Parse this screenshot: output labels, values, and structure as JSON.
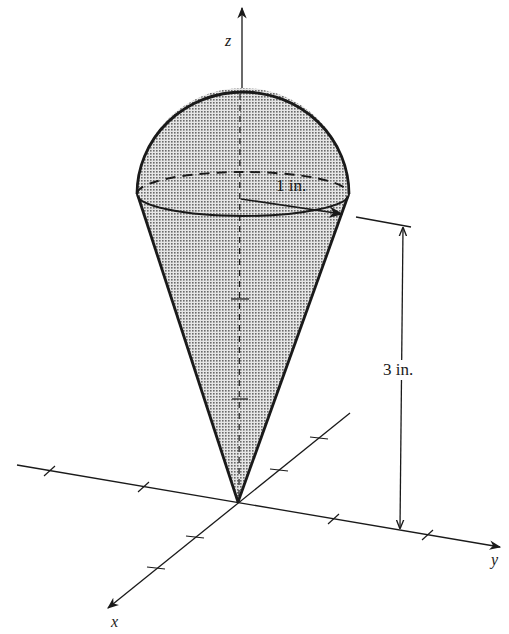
{
  "figure": {
    "type": "3d-diagram",
    "axes": {
      "x_label": "x",
      "y_label": "y",
      "z_label": "z"
    },
    "dimensions": {
      "radius_label": "1 in.",
      "height_label": "3 in."
    },
    "colors": {
      "ink": "#1a1a1a",
      "fill": "#b8b8b8",
      "background": "#ffffff"
    }
  }
}
